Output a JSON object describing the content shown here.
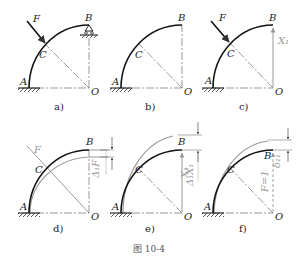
{
  "figure": {
    "caption": "图  10-4",
    "panels": [
      {
        "id": "a",
        "tag": "a)",
        "labels": {
          "A": "A",
          "B": "B",
          "C": "C",
          "O": "O",
          "F": "F"
        }
      },
      {
        "id": "b",
        "tag": "b)",
        "labels": {
          "A": "A",
          "B": "B",
          "C": "C",
          "O": "O"
        }
      },
      {
        "id": "c",
        "tag": "c)",
        "labels": {
          "A": "A",
          "B": "B",
          "C": "C",
          "O": "O",
          "F": "F",
          "X": "X₁"
        }
      },
      {
        "id": "d",
        "tag": "d)",
        "labels": {
          "A": "A",
          "B": "B",
          "C": "C",
          "O": "O",
          "F": "F",
          "delta": "Δ₁F"
        }
      },
      {
        "id": "e",
        "tag": "e)",
        "labels": {
          "A": "A",
          "B": "B",
          "C": "C",
          "O": "O",
          "X": "X₁",
          "delta": "Δ₁X₁"
        }
      },
      {
        "id": "f",
        "tag": "f)",
        "labels": {
          "A": "A",
          "B": "B",
          "C": "C",
          "O": "O",
          "unit": "F=1",
          "delta": "δ₁₁"
        }
      }
    ]
  }
}
